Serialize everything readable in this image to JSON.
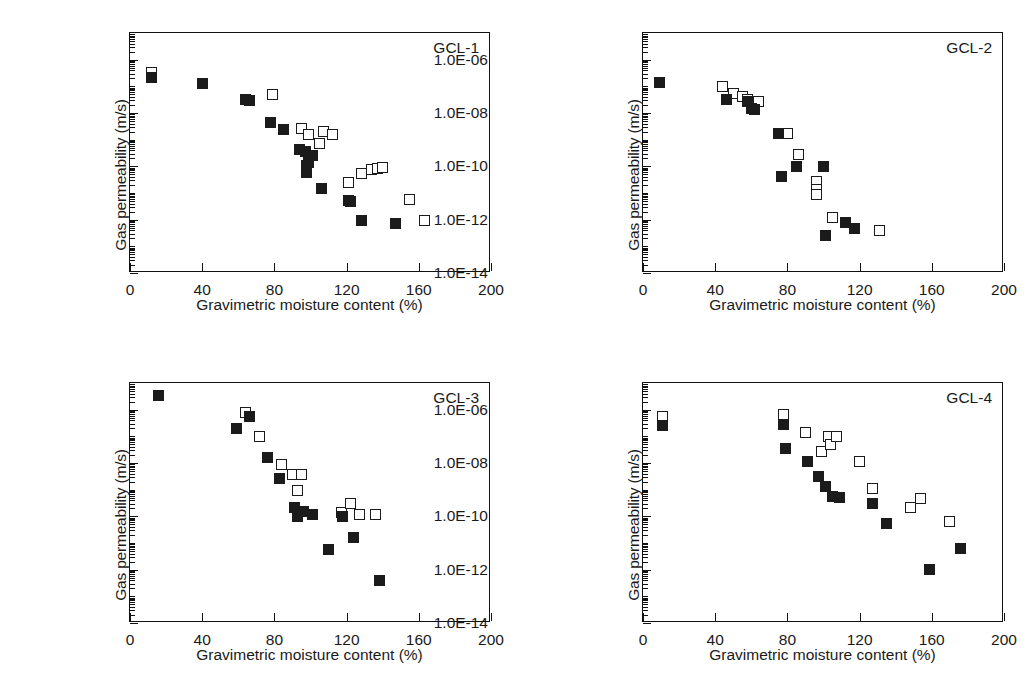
{
  "figure": {
    "panel_count": 4,
    "marker_legend": {
      "filled_square": "filled-square-series",
      "open_square": "open-square-series"
    }
  },
  "axes": {
    "xlabel": "Gravimetric moisture content (%)",
    "ylabel": "Gas permeability (m/s)",
    "xticks": [
      0,
      40,
      80,
      120,
      160,
      200
    ],
    "xticklabels": [
      "0",
      "40",
      "80",
      "120",
      "160",
      "200"
    ],
    "xlim": [
      0,
      200
    ],
    "yticklabels": [
      "1.0E-06",
      "1.0E-08",
      "1.0E-10",
      "1.0E-12",
      "1.0E-14"
    ],
    "ytickvalues": [
      -6,
      -8,
      -10,
      -12,
      -14
    ],
    "ylim_exp": [
      -14,
      -5
    ],
    "yscale": "log",
    "grid": "off",
    "legend": "none"
  },
  "chart_data": [
    {
      "type": "scatter",
      "title": "GCL-1",
      "xlabel": "Gravimetric moisture content (%)",
      "ylabel": "Gas permeability (m/s)",
      "xlim": [
        0,
        200
      ],
      "ylim": [
        1e-14,
        1e-05
      ],
      "yscale": "log",
      "series": [
        {
          "name": "filled-square-series",
          "marker": "filled-square",
          "points": [
            [
              12,
              2.2e-07
            ],
            [
              40,
              1.3e-07
            ],
            [
              64,
              3.3e-08
            ],
            [
              66,
              3e-08
            ],
            [
              78,
              4.5e-09
            ],
            [
              85,
              2.4e-09
            ],
            [
              94,
              4.2e-10
            ],
            [
              97,
              3.6e-10
            ],
            [
              98,
              1.1e-10
            ],
            [
              99,
              1.4e-10
            ],
            [
              101,
              2.6e-10
            ],
            [
              98,
              6e-11
            ],
            [
              106,
              1.5e-11
            ],
            [
              121,
              5.2e-12
            ],
            [
              122,
              4.6e-12
            ],
            [
              128,
              9.5e-13
            ],
            [
              147,
              7e-13
            ]
          ]
        },
        {
          "name": "open-square-series",
          "marker": "open-square",
          "points": [
            [
              12,
              3.2e-07
            ],
            [
              79,
              5e-08
            ],
            [
              95,
              2.6e-09
            ],
            [
              99,
              1.6e-09
            ],
            [
              107,
              2e-09
            ],
            [
              105,
              7e-10
            ],
            [
              112,
              1.5e-09
            ],
            [
              121,
              2.5e-11
            ],
            [
              128,
              5.5e-11
            ],
            [
              134,
              7.5e-11
            ],
            [
              137,
              8.5e-11
            ],
            [
              140,
              8.8e-11
            ],
            [
              155,
              5.5e-12
            ],
            [
              163,
              9.5e-13
            ]
          ]
        }
      ]
    },
    {
      "type": "scatter",
      "title": "GCL-2",
      "xlabel": "Gravimetric moisture content (%)",
      "ylabel": "Gas permeability (m/s)",
      "xlim": [
        0,
        200
      ],
      "ylim": [
        1e-14,
        1e-05
      ],
      "yscale": "log",
      "series": [
        {
          "name": "filled-square-series",
          "marker": "filled-square",
          "points": [
            [
              9,
              1.4e-07
            ],
            [
              46,
              3.2e-08
            ],
            [
              58,
              2.6e-08
            ],
            [
              60,
              1.5e-08
            ],
            [
              62,
              1.3e-08
            ],
            [
              75,
              1.7e-09
            ],
            [
              85,
              9.5e-11
            ],
            [
              77,
              4e-11
            ],
            [
              100,
              9.5e-11
            ],
            [
              112,
              7.5e-13
            ],
            [
              117,
              4.5e-13
            ],
            [
              101,
              2.6e-13
            ]
          ]
        },
        {
          "name": "open-square-series",
          "marker": "open-square",
          "points": [
            [
              44,
              9.5e-08
            ],
            [
              50,
              5.5e-08
            ],
            [
              55,
              4.2e-08
            ],
            [
              58,
              3.2e-08
            ],
            [
              64,
              2.6e-08
            ],
            [
              80,
              1.7e-09
            ],
            [
              86,
              2.8e-10
            ],
            [
              96,
              2.6e-11
            ],
            [
              96,
              1.3e-11
            ],
            [
              96,
              8.5e-12
            ],
            [
              105,
              1.2e-12
            ],
            [
              131,
              4e-13
            ]
          ]
        }
      ]
    },
    {
      "type": "scatter",
      "title": "GCL-3",
      "xlabel": "Gravimetric moisture content (%)",
      "ylabel": "Gas permeability (m/s)",
      "xlim": [
        0,
        200
      ],
      "ylim": [
        1e-14,
        1e-05
      ],
      "yscale": "log",
      "series": [
        {
          "name": "filled-square-series",
          "marker": "filled-square",
          "points": [
            [
              16,
              3.5e-06
            ],
            [
              59,
              2e-07
            ],
            [
              66,
              5.5e-07
            ],
            [
              76,
              1.6e-08
            ],
            [
              83,
              2.6e-09
            ],
            [
              91,
              2.2e-10
            ],
            [
              93,
              1e-10
            ],
            [
              96,
              1.5e-10
            ],
            [
              101,
              1.2e-10
            ],
            [
              110,
              5.5e-12
            ],
            [
              118,
              1e-10
            ],
            [
              124,
              1.6e-11
            ],
            [
              138,
              4e-13
            ]
          ]
        },
        {
          "name": "open-square-series",
          "marker": "open-square",
          "points": [
            [
              64,
              7.5e-07
            ],
            [
              72,
              1e-07
            ],
            [
              84,
              9e-09
            ],
            [
              90,
              3.6e-09
            ],
            [
              95,
              3.6e-09
            ],
            [
              93,
              9e-10
            ],
            [
              117,
              1.4e-10
            ],
            [
              122,
              3e-10
            ],
            [
              127,
              1.2e-10
            ],
            [
              136,
              1.2e-10
            ]
          ]
        }
      ]
    },
    {
      "type": "scatter",
      "title": "GCL-4",
      "xlabel": "Gravimetric moisture content (%)",
      "ylabel": "Gas permeability (m/s)",
      "xlim": [
        0,
        200
      ],
      "ylim": [
        1e-14,
        1e-05
      ],
      "yscale": "log",
      "series": [
        {
          "name": "filled-square-series",
          "marker": "filled-square",
          "points": [
            [
              11,
              2.6e-07
            ],
            [
              78,
              2.8e-07
            ],
            [
              79,
              3.4e-08
            ],
            [
              91,
              1.1e-08
            ],
            [
              97,
              3.2e-09
            ],
            [
              101,
              1.3e-09
            ],
            [
              105,
              5.5e-10
            ],
            [
              109,
              5e-10
            ],
            [
              127,
              3e-10
            ],
            [
              135,
              5.5e-11
            ],
            [
              159,
              1e-12
            ],
            [
              176,
              6e-12
            ]
          ]
        },
        {
          "name": "open-square-series",
          "marker": "open-square",
          "points": [
            [
              11,
              5.5e-07
            ],
            [
              78,
              6.5e-07
            ],
            [
              90,
              1.4e-07
            ],
            [
              99,
              2.6e-08
            ],
            [
              103,
              1e-07
            ],
            [
              104,
              5e-08
            ],
            [
              107,
              1e-07
            ],
            [
              120,
              1.1e-08
            ],
            [
              127,
              1.1e-09
            ],
            [
              148,
              2.2e-10
            ],
            [
              154,
              4.5e-10
            ],
            [
              170,
              6.5e-11
            ]
          ]
        }
      ]
    }
  ]
}
